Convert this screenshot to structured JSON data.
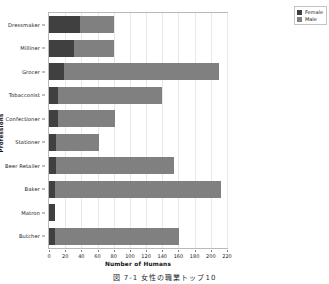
{
  "chart_data": {
    "type": "bar",
    "orientation": "horizontal",
    "stacked": true,
    "title": "",
    "xlabel": "Number of Humans",
    "ylabel": "Professions",
    "xlim": [
      0,
      220
    ],
    "ylim": null,
    "grid": true,
    "legend_position": "top-right",
    "categories": [
      "Dressmaker",
      "Milliner",
      "Grocer",
      "Tobacconist",
      "Confectioner",
      "Stationer",
      "Beer Retailer",
      "Baker",
      "Matron",
      "Butcher"
    ],
    "series": [
      {
        "name": "Female",
        "color": "#404040",
        "values": [
          38,
          31,
          18,
          11,
          11,
          9,
          9,
          8,
          7,
          7
        ]
      },
      {
        "name": "Male",
        "color": "#808080",
        "values": [
          42,
          49,
          192,
          129,
          70,
          53,
          146,
          204,
          0,
          154
        ]
      }
    ],
    "totals": [
      80,
      80,
      210,
      140,
      81,
      62,
      155,
      212,
      7,
      161
    ],
    "xticks": [
      0,
      20,
      40,
      60,
      80,
      100,
      120,
      140,
      160,
      180,
      200,
      220
    ],
    "xtick_labels": [
      "0",
      "20",
      "40",
      "60",
      "80",
      "100",
      "120",
      "140",
      "160",
      "180",
      "200",
      "220"
    ]
  },
  "legend": {
    "items": [
      {
        "label": "Female",
        "color": "#404040"
      },
      {
        "label": "Male",
        "color": "#808080"
      }
    ]
  },
  "caption": {
    "text": "図 7-1  女性の職業トップ10"
  }
}
